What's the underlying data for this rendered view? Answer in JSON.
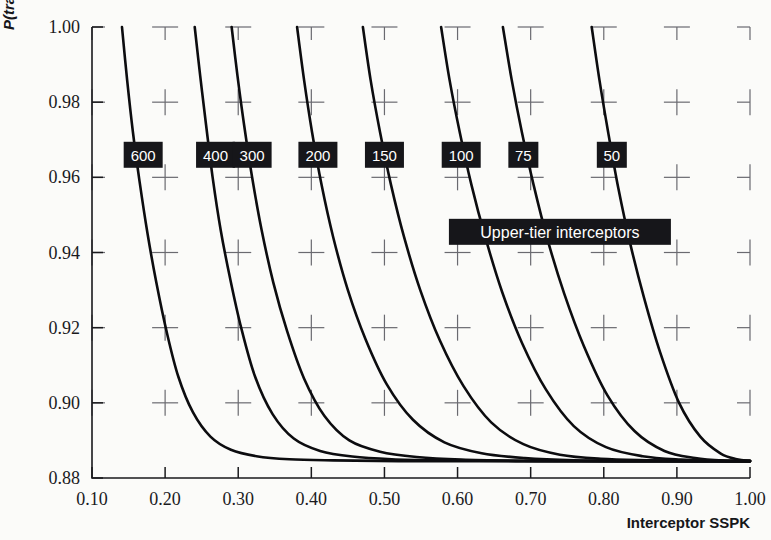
{
  "chart_data": {
    "type": "line",
    "title": "",
    "xlabel": "Interceptor SSPK",
    "ylabel": "P(track)",
    "xlim": [
      0.1,
      1.0
    ],
    "ylim": [
      0.88,
      1.0
    ],
    "xticks": [
      "0.10",
      "0.20",
      "0.30",
      "0.40",
      "0.50",
      "0.60",
      "0.70",
      "0.80",
      "0.90",
      "1.00"
    ],
    "xtick_values": [
      0.1,
      0.2,
      0.3,
      0.4,
      0.5,
      0.6,
      0.7,
      0.8,
      0.9,
      1.0
    ],
    "yticks": [
      "1.00",
      "0.98",
      "0.96",
      "0.94",
      "0.92",
      "0.90",
      "0.88"
    ],
    "ytick_values": [
      1.0,
      0.98,
      0.96,
      0.94,
      0.92,
      0.9,
      0.88
    ],
    "grid": "cross-markers at each tick intersection",
    "legend": "inline labeled boxes on each curve",
    "annotation": "Upper-tier interceptors",
    "asymptote_y": 0.8845,
    "convergence_point": [
      1.0,
      0.8845
    ],
    "series": [
      {
        "name": "600",
        "label": "600",
        "top_x": 0.141,
        "points": [
          [
            0.141,
            1.0
          ],
          [
            0.148,
            0.986
          ],
          [
            0.156,
            0.972
          ],
          [
            0.165,
            0.959
          ],
          [
            0.176,
            0.945
          ],
          [
            0.188,
            0.932
          ],
          [
            0.202,
            0.919
          ],
          [
            0.218,
            0.907
          ],
          [
            0.238,
            0.8975
          ],
          [
            0.262,
            0.891
          ],
          [
            0.29,
            0.8875
          ],
          [
            0.325,
            0.8858
          ],
          [
            0.37,
            0.885
          ],
          [
            0.43,
            0.8847
          ],
          [
            0.52,
            0.8845
          ],
          [
            0.65,
            0.8845
          ],
          [
            0.8,
            0.8845
          ],
          [
            1.0,
            0.8845
          ]
        ]
      },
      {
        "name": "400",
        "label": "400",
        "top_x": 0.2405,
        "points": [
          [
            0.2405,
            1.0
          ],
          [
            0.248,
            0.987
          ],
          [
            0.256,
            0.974
          ],
          [
            0.265,
            0.96
          ],
          [
            0.276,
            0.946
          ],
          [
            0.289,
            0.933
          ],
          [
            0.304,
            0.92
          ],
          [
            0.323,
            0.907
          ],
          [
            0.347,
            0.897
          ],
          [
            0.376,
            0.8905
          ],
          [
            0.412,
            0.8872
          ],
          [
            0.456,
            0.8857
          ],
          [
            0.51,
            0.885
          ],
          [
            0.58,
            0.8847
          ],
          [
            0.68,
            0.8845
          ],
          [
            0.82,
            0.8845
          ],
          [
            1.0,
            0.8845
          ]
        ]
      },
      {
        "name": "300",
        "label": "300",
        "top_x": 0.291,
        "points": [
          [
            0.291,
            1.0
          ],
          [
            0.299,
            0.987
          ],
          [
            0.308,
            0.974
          ],
          [
            0.319,
            0.96
          ],
          [
            0.332,
            0.946
          ],
          [
            0.348,
            0.932
          ],
          [
            0.367,
            0.919
          ],
          [
            0.39,
            0.9065
          ],
          [
            0.418,
            0.8965
          ],
          [
            0.452,
            0.89
          ],
          [
            0.494,
            0.887
          ],
          [
            0.544,
            0.8856
          ],
          [
            0.605,
            0.8849
          ],
          [
            0.69,
            0.8846
          ],
          [
            0.8,
            0.8845
          ],
          [
            1.0,
            0.8845
          ]
        ]
      },
      {
        "name": "200",
        "label": "200",
        "top_x": 0.3805,
        "points": [
          [
            0.3805,
            1.0
          ],
          [
            0.39,
            0.986
          ],
          [
            0.401,
            0.972
          ],
          [
            0.414,
            0.958
          ],
          [
            0.43,
            0.944
          ],
          [
            0.45,
            0.93
          ],
          [
            0.474,
            0.917
          ],
          [
            0.503,
            0.905
          ],
          [
            0.539,
            0.8955
          ],
          [
            0.582,
            0.8895
          ],
          [
            0.633,
            0.8866
          ],
          [
            0.692,
            0.8853
          ],
          [
            0.76,
            0.8847
          ],
          [
            0.85,
            0.8845
          ],
          [
            1.0,
            0.8845
          ]
        ]
      },
      {
        "name": "150",
        "label": "150",
        "top_x": 0.4705,
        "points": [
          [
            0.4705,
            1.0
          ],
          [
            0.481,
            0.986
          ],
          [
            0.494,
            0.972
          ],
          [
            0.509,
            0.958
          ],
          [
            0.527,
            0.944
          ],
          [
            0.549,
            0.93
          ],
          [
            0.576,
            0.9165
          ],
          [
            0.608,
            0.9045
          ],
          [
            0.646,
            0.8948
          ],
          [
            0.69,
            0.889
          ],
          [
            0.74,
            0.8862
          ],
          [
            0.796,
            0.8851
          ],
          [
            0.86,
            0.8847
          ],
          [
            0.93,
            0.8845
          ],
          [
            1.0,
            0.8845
          ]
        ]
      },
      {
        "name": "100",
        "label": "100",
        "top_x": 0.5775,
        "points": [
          [
            0.5775,
            1.0
          ],
          [
            0.589,
            0.986
          ],
          [
            0.603,
            0.972
          ],
          [
            0.619,
            0.958
          ],
          [
            0.638,
            0.944
          ],
          [
            0.661,
            0.9295
          ],
          [
            0.688,
            0.916
          ],
          [
            0.721,
            0.9035
          ],
          [
            0.759,
            0.8938
          ],
          [
            0.803,
            0.8882
          ],
          [
            0.853,
            0.8858
          ],
          [
            0.905,
            0.8849
          ],
          [
            0.955,
            0.8846
          ],
          [
            1.0,
            0.8845
          ]
        ]
      },
      {
        "name": "75",
        "label": "75",
        "top_x": 0.662,
        "points": [
          [
            0.662,
            1.0
          ],
          [
            0.674,
            0.986
          ],
          [
            0.688,
            0.972
          ],
          [
            0.704,
            0.958
          ],
          [
            0.723,
            0.9435
          ],
          [
            0.746,
            0.929
          ],
          [
            0.773,
            0.915
          ],
          [
            0.805,
            0.902
          ],
          [
            0.842,
            0.8925
          ],
          [
            0.883,
            0.8872
          ],
          [
            0.925,
            0.8853
          ],
          [
            0.965,
            0.8846
          ],
          [
            1.0,
            0.8845
          ]
        ]
      },
      {
        "name": "50",
        "label": "50",
        "top_x": 0.7835,
        "points": [
          [
            0.7835,
            1.0
          ],
          [
            0.794,
            0.986
          ],
          [
            0.806,
            0.972
          ],
          [
            0.82,
            0.957
          ],
          [
            0.836,
            0.9425
          ],
          [
            0.855,
            0.928
          ],
          [
            0.877,
            0.9135
          ],
          [
            0.903,
            0.9
          ],
          [
            0.932,
            0.891
          ],
          [
            0.96,
            0.8865
          ],
          [
            0.982,
            0.885
          ],
          [
            1.0,
            0.8845
          ]
        ]
      }
    ],
    "curve_label_boxes": [
      {
        "label": "600",
        "x_center": 0.17,
        "y_value": 0.966
      },
      {
        "label": "400",
        "x_center": 0.269,
        "y_value": 0.966
      },
      {
        "label": "300",
        "x_center": 0.319,
        "y_value": 0.966
      },
      {
        "label": "200",
        "x_center": 0.409,
        "y_value": 0.966
      },
      {
        "label": "150",
        "x_center": 0.5,
        "y_value": 0.966
      },
      {
        "label": "100",
        "x_center": 0.605,
        "y_value": 0.966
      },
      {
        "label": "75",
        "x_center": 0.69,
        "y_value": 0.966
      },
      {
        "label": "50",
        "x_center": 0.811,
        "y_value": 0.966
      }
    ],
    "annotation_box": {
      "text": "Upper-tier interceptors",
      "x_center": 0.74,
      "y_value": 0.9455
    }
  },
  "axes": {
    "y_axis_title": "P(track)",
    "x_axis_title": "Interceptor SSPK"
  },
  "colors": {
    "background": "#fbfbf9",
    "curve": "#0c0c0f",
    "axis": "#1a1a1d",
    "grid": "#6a6a70",
    "label_box_bg": "#16161a",
    "label_box_text": "#ffffff"
  }
}
